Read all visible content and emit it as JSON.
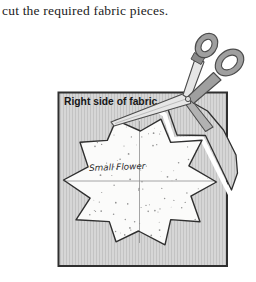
{
  "caption": "cut the required fabric pieces.",
  "diagram": {
    "fabric_label": "Right side of fabric",
    "template_label": "Small Flower",
    "colors": {
      "page_bg": "#ffffff",
      "fabric": "#d6d6d6",
      "hatch": "#c3c3c3",
      "border": "#2f2f2f",
      "star_fill": "#fbfbfa",
      "star_outline": "#2f2f2f",
      "speckle": "#808080",
      "guide": "#8f8f8f",
      "cut": "#ffffff",
      "handle": "#9f9f9f",
      "handle_dark": "#4c4c4c",
      "handle_cap": "#8a8a8a",
      "blade": "#e6e6e6",
      "blade_dark": "#b2b2b2",
      "pivot": "#dedede",
      "hole": "#ffffff"
    }
  }
}
